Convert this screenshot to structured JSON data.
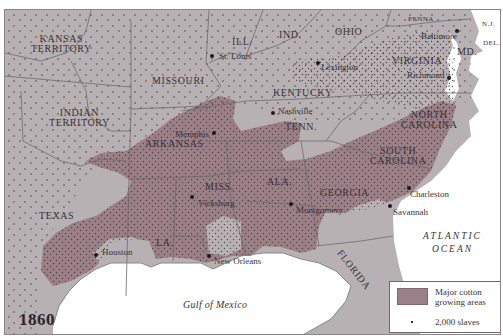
{
  "map": {
    "year": "1860",
    "colors": {
      "land": "#b7b1b4",
      "cotton_region": "#9a7f87",
      "water": "#ffffff",
      "borders": "#6f696c",
      "dots": "#3b2a30",
      "text": "#3a3336"
    },
    "states": [
      {
        "name": "KANSAS\nTERRITORY",
        "line1": "KANSAS",
        "line2": "TERRITORY"
      },
      {
        "name": "INDIAN TERRITORY",
        "line1": "INDIAN",
        "line2": "TERRITORY"
      },
      {
        "name": "MISSOURI"
      },
      {
        "name": "ILL."
      },
      {
        "name": "IND."
      },
      {
        "name": "OHIO"
      },
      {
        "name": "PENNA"
      },
      {
        "name": "N.J."
      },
      {
        "name": "DEL."
      },
      {
        "name": "MD."
      },
      {
        "name": "VIRGINIA"
      },
      {
        "name": "KENTUCKY"
      },
      {
        "name": "TENN."
      },
      {
        "name": "NORTH CAROLINA",
        "line1": "NORTH",
        "line2": "CAROLINA"
      },
      {
        "name": "SOUTH CAROLINA",
        "line1": "SOUTH",
        "line2": "CAROLINA"
      },
      {
        "name": "ARKANSAS"
      },
      {
        "name": "MISS."
      },
      {
        "name": "ALA."
      },
      {
        "name": "GEORGIA"
      },
      {
        "name": "TEXAS"
      },
      {
        "name": "LA."
      },
      {
        "name": "FLORIDA"
      }
    ],
    "cities": [
      {
        "name": "St. Louis"
      },
      {
        "name": "Lexington"
      },
      {
        "name": "Baltimore"
      },
      {
        "name": "Richmond"
      },
      {
        "name": "Nashville"
      },
      {
        "name": "Memphis"
      },
      {
        "name": "Vicksburg"
      },
      {
        "name": "Montgomery"
      },
      {
        "name": "Charleston"
      },
      {
        "name": "Savannah"
      },
      {
        "name": "Houston"
      },
      {
        "name": "New Orleans"
      }
    ],
    "water_bodies": {
      "atlantic_line1": "ATLANTIC",
      "atlantic_line2": "OCEAN",
      "gulf": "Gulf of Mexico"
    },
    "legend": {
      "cotton_label_line1": "Major cotton",
      "cotton_label_line2": "growing areas",
      "dot_label": "2,000 slaves"
    }
  }
}
